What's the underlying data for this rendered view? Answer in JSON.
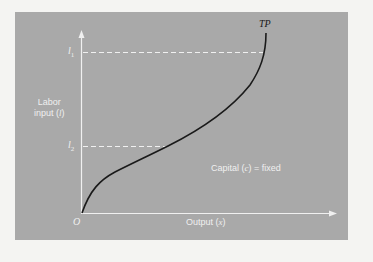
{
  "diagram": {
    "curve_label": "TP",
    "y_axis": {
      "label_line1": "Labor",
      "label_line2": "input (",
      "label_var": "l",
      "label_close": ")"
    },
    "x_axis": {
      "label_text": "Output (",
      "label_var": "x",
      "label_close": ")"
    },
    "origin_label": "O",
    "tick_l1": {
      "base": "l",
      "sub": "1"
    },
    "tick_l2": {
      "base": "l",
      "sub": "2"
    },
    "annotation": {
      "prefix": "Capital (",
      "var": "c",
      "suffix": ") = fixed"
    },
    "colors": {
      "panel": "#a9a9a9",
      "background": "#f4f4f2",
      "curve": "#1a1a1a",
      "axis": "#f0f0f0",
      "text": "#f0f0f0"
    }
  }
}
